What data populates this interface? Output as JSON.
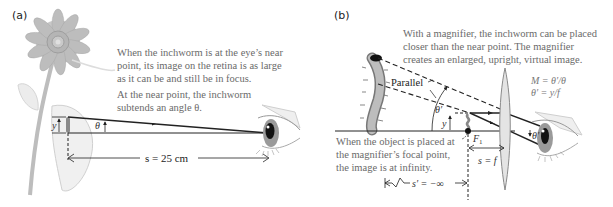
{
  "panel_a": {
    "label": "(a)",
    "caption_1": [
      "When the inchworm is at the eye’s near",
      "point, its image on the retina is as large",
      "as it can be and still be in focus."
    ],
    "caption_2": [
      "At the near point, the inchworm",
      "subtends an angle θ."
    ],
    "height_label": "y",
    "angle_label": "θ",
    "distance_label": "s = 25 cm"
  },
  "panel_b": {
    "label": "(b)",
    "caption_top": [
      "With a magnifier, the inchworm can be placed",
      "closer than the near point. The magnifier",
      "creates an enlarged, upright, virtual image."
    ],
    "parallel_label": "Parallel",
    "angle_label": "θ′",
    "height_label": "y",
    "focal_point_label": "F",
    "focal_point_subscript": "1",
    "eye_angle_label": "θ′",
    "formula_1": "M = θ′/θ",
    "formula_2": "θ′ = y/f",
    "caption_bottom": [
      "When the object is placed at",
      "the magnifier’s focal point,",
      "the image is at infinity."
    ],
    "focal_distance_label": "s = f",
    "image_distance_label": "s′ = −∞"
  }
}
